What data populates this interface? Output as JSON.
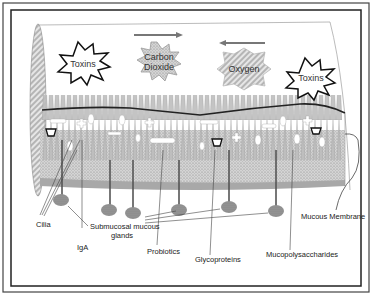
{
  "diagram": {
    "shapes": {
      "toxins_left": "Toxins",
      "carbon_dioxide_line1": "Carbon",
      "carbon_dioxide_line2": "Dioxide",
      "oxygen": "Oxygen",
      "toxins_right": "Toxins"
    },
    "arrows": {
      "carbon_dioxide_direction": "right",
      "oxygen_direction": "left"
    },
    "labels": {
      "cilia": "Cilia",
      "submucosal_line1": "Submucosal mucous",
      "submucosal_line2": "glands",
      "iga": "IgA",
      "probiotics": "Probiotics",
      "glycoproteins": "Glycoproteins",
      "mucopolysaccharides": "Mucopolysaccharides",
      "mucous_membrane": "Mucous Membrane"
    },
    "colors": {
      "border": "#222222",
      "membrane_fill": "#c8c8c8",
      "gland_fill": "#8a8a8a",
      "arrow": "#777777"
    }
  }
}
